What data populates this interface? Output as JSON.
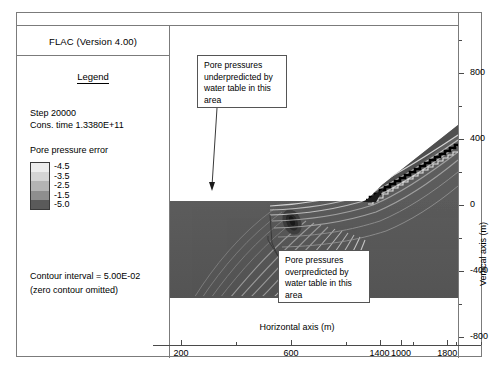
{
  "window": {
    "title": "FLAC (Version 4.00)"
  },
  "legend": {
    "heading": "Legend",
    "step_line": "Step 20000",
    "time_line": "Cons. time 1.3380E+11",
    "variable_name": "Pore pressure error",
    "swatches": [
      {
        "label": "-4.5",
        "color": "#ededed"
      },
      {
        "label": "-3.5",
        "color": "#d4d4d4"
      },
      {
        "label": "-2.5",
        "color": "#b4b4b4"
      },
      {
        "label": "-1.5",
        "color": "#8e8e8e"
      },
      {
        "label": "-5.0",
        "color": "#5a5a5a"
      }
    ],
    "footer_line1": "Contour interval = 5.00E-02",
    "footer_line2": "(zero contour omitted)"
  },
  "annotations": [
    {
      "name": "underpredicted-callout",
      "lines": [
        "Pore pressures",
        "underpredicted by",
        "water table in this",
        "area"
      ]
    },
    {
      "name": "overpredicted-callout",
      "lines": [
        "Pore pressures",
        "overpredicted by",
        "water table in this",
        "area"
      ]
    }
  ],
  "chart_data": {
    "type": "heatmap",
    "title": "Pore pressure error",
    "xlabel": "Horizontal axis (m)",
    "ylabel": "Vertical axis (m)",
    "xlim": [
      60,
      2000
    ],
    "ylim": [
      -1000,
      1000
    ],
    "x_ticks": [
      200,
      600,
      1000,
      1400,
      1800
    ],
    "x_minor_ticks": [
      400,
      800,
      1200,
      1600,
      2000
    ],
    "y_ticks": [
      800,
      400,
      0,
      -400,
      -800
    ],
    "y_minor_ticks": [
      1000,
      600,
      200,
      -200,
      -600
    ],
    "grid": false,
    "legend_position": "left-panel",
    "contour_interval": 0.05,
    "zero_contour_omitted": true,
    "contour_levels": [
      -4.5,
      -3.5,
      -2.5,
      -1.5,
      -5.0
    ],
    "colors": {
      "ground_fill": "#585858",
      "contour_line": "#9a9a9a",
      "water_table": "#000000",
      "frame": "#7b7b7b",
      "axis": "#4a4a4a",
      "background": "#ffffff"
    },
    "geometry": {
      "ground_surface_left_m": 0,
      "toe_x_m": 560,
      "crest_x_m": 2000,
      "base_elevation_m": -400,
      "plateau_elevation_m": 0,
      "crest_elevation_m": 470,
      "water_table_note": "stepped phreatic surface following slope face"
    }
  },
  "axes": {
    "x_title": "Horizontal axis (m)",
    "y_title": "Vertical axis (m)",
    "x_tick_labels": [
      "200",
      "600",
      "1000",
      "1400",
      "1800"
    ],
    "y_tick_labels": [
      "800",
      "400",
      "0",
      "-400",
      "-800"
    ]
  }
}
